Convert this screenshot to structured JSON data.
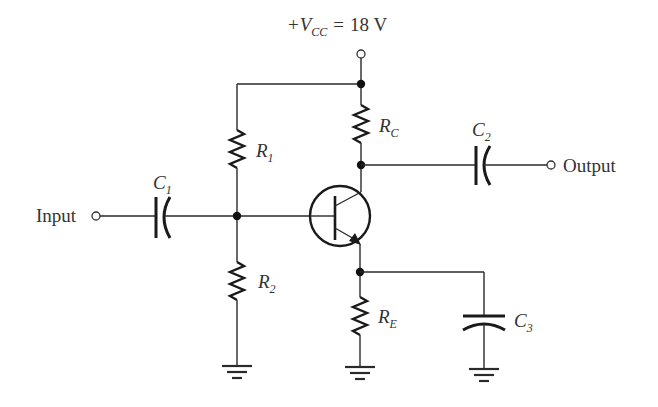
{
  "supply": {
    "prefix": "+",
    "symbol": "V",
    "subscript": "CC",
    "equals": "=",
    "value": "18 V"
  },
  "terminals": {
    "input": "Input",
    "output": "Output"
  },
  "components": {
    "R1": {
      "symbol": "R",
      "subscript": "1"
    },
    "R2": {
      "symbol": "R",
      "subscript": "2"
    },
    "RC": {
      "symbol": "R",
      "subscript": "C"
    },
    "RE": {
      "symbol": "R",
      "subscript": "E"
    },
    "C1": {
      "symbol": "C",
      "subscript": "1"
    },
    "C2": {
      "symbol": "C",
      "subscript": "2"
    },
    "C3": {
      "symbol": "C",
      "subscript": "3"
    },
    "Q1": {
      "type": "NPN transistor"
    }
  },
  "colors": {
    "ink": "#1a1a1a",
    "background": "#ffffff"
  }
}
